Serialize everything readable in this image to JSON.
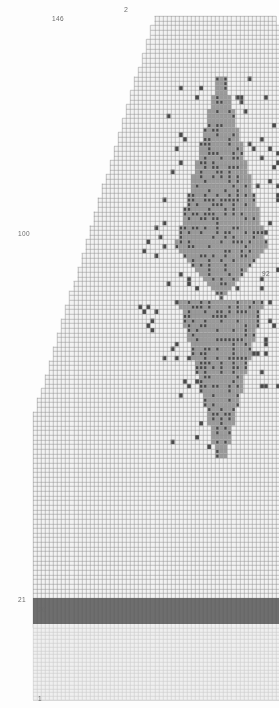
{
  "figure": {
    "kind": "raster-grid-plot",
    "title_top": "2",
    "background": "#fdfdfd",
    "grid_line_color": "#8f8f8f",
    "cell_fill_empty": "#f2f2f2",
    "cell_fill_pattern": "#9a9a9a",
    "cell_fill_dark": "#4a4a4a",
    "band_color": "#6e6e6e",
    "lower_grid_color": "#c9c9c9",
    "label_color": "#6b6b6b"
  },
  "axis_labels": {
    "top": [
      {
        "name": "top-tick-2",
        "text": "2",
        "x": 124,
        "y": 6
      }
    ],
    "left": [
      {
        "name": "left-tick-146",
        "text": "146",
        "x": 52,
        "y": 16
      },
      {
        "name": "left-tick-100",
        "text": "100",
        "x": 18,
        "y": 231
      },
      {
        "name": "left-tick-21",
        "text": "21",
        "x": 18,
        "y": 597
      },
      {
        "name": "left-tick-20",
        "text": "20",
        "x": 38,
        "y": 607
      },
      {
        "name": "left-tick-1",
        "text": "1",
        "x": 38,
        "y": 696
      }
    ],
    "right": [
      {
        "name": "right-tick-92",
        "text": "92",
        "x": 262,
        "y": 271
      }
    ]
  },
  "chart_data": {
    "type": "heatmap",
    "title": "2",
    "xlabel": "",
    "ylabel": "",
    "grid": true,
    "legend_position": "none",
    "cell_size_px": 4.05,
    "rows": 146,
    "cols": 92,
    "axis_ranges": {
      "y_top": 146,
      "y_mid": 100,
      "y_band_upper": 21,
      "y_band_lower": 20,
      "y_bottom": 1,
      "x_max": 92
    },
    "tick_labels": {
      "left": [
        "146",
        "100",
        "21",
        "20",
        "1"
      ],
      "right": [
        "92"
      ],
      "top": [
        "2"
      ]
    },
    "regions": [
      {
        "name": "upper-trapezoid-grid",
        "description": "light grid with staircase left and right edges, narrow at top widening downward",
        "row_from": 21,
        "row_to": 146
      },
      {
        "name": "dark-band",
        "description": "solid dark horizontal band spanning full width",
        "row_from": 20,
        "row_to": 21
      },
      {
        "name": "lower-grid",
        "description": "faint full-width grid below the dark band",
        "row_from": 1,
        "row_to": 20
      }
    ],
    "pattern": {
      "name": "bowtie-cone",
      "description": "Dense filled cells forming an upper downward-widening cone joined by a narrow waist to a lower inverted triangle, flanked by sparse scattered single cells along diagonal arms",
      "apex_top": {
        "x_col": 46,
        "y_row": 133
      },
      "waist": {
        "x_col": 46,
        "y_row": 86
      },
      "lower_tip": {
        "x_col": 46,
        "y_row": 52
      }
    }
  }
}
